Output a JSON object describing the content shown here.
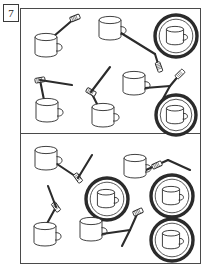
{
  "figure": {
    "label": "7",
    "label_name": "figure-number-7",
    "background_color": "#ffffff",
    "ink_color": "#2b2b2b",
    "frame_color": "#4a4a4a",
    "width": 209,
    "height": 271
  },
  "panels": [
    {
      "name": "top-panel",
      "x": 20,
      "y": 8,
      "width": 180,
      "height": 125,
      "objects": [
        {
          "id": "t1",
          "type": "mug-with-stick",
          "mug_x": 46,
          "mug_y": 47,
          "mug_scale": 1.0,
          "stick_x1": 47,
          "stick_y1": 42,
          "stick_x2": 75,
          "stick_y2": 18,
          "head": "far",
          "head_angle": -22
        },
        {
          "id": "t2",
          "type": "mug-with-stick",
          "mug_x": 110,
          "mug_y": 30,
          "mug_scale": 1.0,
          "stick_x1": 121,
          "stick_y1": 33,
          "stick_x2": 155,
          "stick_y2": 54,
          "head": "none",
          "head_angle": 0
        },
        {
          "id": "t2b",
          "type": "stick-only",
          "stick_x1": 155,
          "stick_y1": 54,
          "stick_x2": 159,
          "stick_y2": 67,
          "head": "far",
          "head_angle": 70
        },
        {
          "id": "t3",
          "type": "mug-in-saucer",
          "cx": 176,
          "cy": 36,
          "r": 21
        },
        {
          "id": "t4",
          "type": "mug-with-stick",
          "mug_x": 47,
          "mug_y": 112,
          "mug_scale": 1.0,
          "stick_x1": 45,
          "stick_y1": 105,
          "stick_x2": 40,
          "stick_y2": 80,
          "head": "far",
          "head_angle": -10
        },
        {
          "id": "t4b",
          "type": "stick-only",
          "stick_x1": 40,
          "stick_y1": 80,
          "stick_x2": 72,
          "stick_y2": 85,
          "head": "none",
          "head_angle": 0
        },
        {
          "id": "t5",
          "type": "mug-with-stick",
          "mug_x": 103,
          "mug_y": 117,
          "mug_scale": 1.0,
          "stick_x1": 100,
          "stick_y1": 110,
          "stick_x2": 91,
          "stick_y2": 92,
          "head": "far",
          "head_angle": 30
        },
        {
          "id": "t5b",
          "type": "stick-only",
          "stick_x1": 91,
          "stick_y1": 92,
          "stick_x2": 110,
          "stick_y2": 67,
          "head": "none",
          "head_angle": 0
        },
        {
          "id": "t6",
          "type": "mug-with-stick",
          "mug_x": 134,
          "mug_y": 85,
          "mug_scale": 1.0,
          "stick_x1": 145,
          "stick_y1": 88,
          "stick_x2": 170,
          "stick_y2": 86,
          "head": "none",
          "head_angle": 0
        },
        {
          "id": "t6b",
          "type": "stick-only",
          "stick_x1": 170,
          "stick_y1": 86,
          "stick_x2": 180,
          "stick_y2": 74,
          "head": "far",
          "head_angle": -45
        },
        {
          "id": "t6c",
          "type": "stick-only",
          "stick_x1": 170,
          "stick_y1": 86,
          "stick_x2": 160,
          "stick_y2": 104,
          "head": "none",
          "head_angle": 0
        },
        {
          "id": "t7",
          "type": "mug-in-saucer",
          "cx": 176,
          "cy": 115,
          "r": 20
        }
      ]
    },
    {
      "name": "bottom-panel",
      "x": 20,
      "y": 133,
      "width": 180,
      "height": 130,
      "objects": [
        {
          "id": "b1",
          "type": "mug-with-stick",
          "mug_x": 46,
          "mug_y": 160,
          "mug_scale": 1.0,
          "stick_x1": 57,
          "stick_y1": 164,
          "stick_x2": 78,
          "stick_y2": 178,
          "head": "far",
          "head_angle": 55
        },
        {
          "id": "b1b",
          "type": "stick-only",
          "stick_x1": 78,
          "stick_y1": 178,
          "stick_x2": 92,
          "stick_y2": 155,
          "head": "none",
          "head_angle": 0
        },
        {
          "id": "b2",
          "type": "mug-with-stick",
          "mug_x": 135,
          "mug_y": 168,
          "mug_scale": 1.0,
          "stick_x1": 146,
          "stick_y1": 170,
          "stick_x2": 168,
          "stick_y2": 160,
          "head": "mid",
          "head_angle": -25
        },
        {
          "id": "b2b",
          "type": "stick-only",
          "stick_x1": 168,
          "stick_y1": 160,
          "stick_x2": 190,
          "stick_y2": 170,
          "head": "none",
          "head_angle": 0
        },
        {
          "id": "b3",
          "type": "mug-in-saucer",
          "cx": 107,
          "cy": 199,
          "r": 21
        },
        {
          "id": "b4",
          "type": "mug-in-saucer",
          "cx": 172,
          "cy": 196,
          "r": 21
        },
        {
          "id": "b5",
          "type": "mug-with-stick",
          "mug_x": 45,
          "mug_y": 236,
          "mug_scale": 1.0,
          "stick_x1": 44,
          "stick_y1": 229,
          "stick_x2": 56,
          "stick_y2": 207,
          "head": "far",
          "head_angle": 55
        },
        {
          "id": "b5b",
          "type": "stick-only",
          "stick_x1": 56,
          "stick_y1": 207,
          "stick_x2": 48,
          "stick_y2": 186,
          "head": "none",
          "head_angle": 0
        },
        {
          "id": "b6",
          "type": "mug-with-stick",
          "mug_x": 91,
          "mug_y": 231,
          "mug_scale": 1.0,
          "stick_x1": 102,
          "stick_y1": 234,
          "stick_x2": 130,
          "stick_y2": 230,
          "head": "none",
          "head_angle": 0
        },
        {
          "id": "b6b",
          "type": "stick-only",
          "stick_x1": 130,
          "stick_y1": 230,
          "stick_x2": 138,
          "stick_y2": 212,
          "head": "far",
          "head_angle": -25
        },
        {
          "id": "b6c",
          "type": "stick-only",
          "stick_x1": 130,
          "stick_y1": 230,
          "stick_x2": 122,
          "stick_y2": 246,
          "head": "none",
          "head_angle": 0
        },
        {
          "id": "b7",
          "type": "mug-in-saucer",
          "cx": 172,
          "cy": 240,
          "r": 21
        }
      ]
    }
  ]
}
